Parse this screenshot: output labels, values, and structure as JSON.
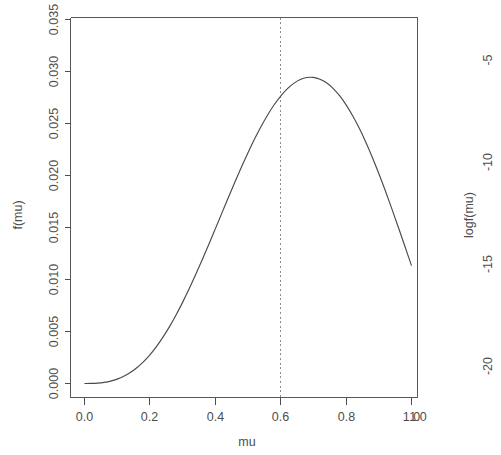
{
  "figure": {
    "background_color": "#ffffff",
    "line_color": "#4a4a4a",
    "text_color": "#4d4d4d",
    "vline_color": "#8c8c8c"
  },
  "panels": {
    "left": {
      "name": "density-panel",
      "xlabel": "mu",
      "ylabel": "f(mu)",
      "x_ticks": [
        "0.0",
        "0.2",
        "0.4",
        "0.6",
        "0.8",
        "1.0"
      ],
      "y_ticks": [
        "0.000",
        "0.005",
        "0.010",
        "0.015",
        "0.020",
        "0.025",
        "0.030",
        "0.035"
      ]
    },
    "right": {
      "name": "log-density-panel",
      "ylabel": "logf(mu)",
      "x_ticks": [
        "1.0"
      ],
      "y_ticks": [
        "-5",
        "-10",
        "-15",
        "-20"
      ]
    }
  },
  "chart_data": {
    "type": "line",
    "title": "",
    "xlabel": "mu",
    "ylabel": "f(mu)",
    "xlim": [
      0.0,
      1.0
    ],
    "ylim": [
      0.0,
      0.0355
    ],
    "grid": false,
    "legend": null,
    "x_ticks": [
      0.0,
      0.2,
      0.4,
      0.6,
      0.8,
      1.0
    ],
    "y_ticks": [
      0.0,
      0.005,
      0.01,
      0.015,
      0.02,
      0.025,
      0.03,
      0.035
    ],
    "series": [
      {
        "name": "f(mu)",
        "x": [
          0.0,
          0.02,
          0.04,
          0.06,
          0.08,
          0.1,
          0.12,
          0.14,
          0.16,
          0.18,
          0.2,
          0.22,
          0.24,
          0.26,
          0.28,
          0.3,
          0.32,
          0.34,
          0.36,
          0.38,
          0.4,
          0.42,
          0.44,
          0.46,
          0.48,
          0.5,
          0.52,
          0.54,
          0.56,
          0.58,
          0.6,
          0.62,
          0.64,
          0.66,
          0.68,
          0.7,
          0.72,
          0.74,
          0.76,
          0.78,
          0.8,
          0.82,
          0.84,
          0.86,
          0.88,
          0.9,
          0.92,
          0.94,
          0.96,
          0.98,
          1.0
        ],
        "y": [
          0.0,
          1e-05,
          4e-05,
          0.00011,
          0.00023,
          0.00042,
          0.00069,
          0.00105,
          0.00151,
          0.00208,
          0.00276,
          0.00355,
          0.00446,
          0.00547,
          0.00659,
          0.0078,
          0.0091,
          0.01047,
          0.0119,
          0.01337,
          0.01487,
          0.01638,
          0.01789,
          0.01937,
          0.02081,
          0.02219,
          0.0235,
          0.02471,
          0.02582,
          0.0268,
          0.02764,
          0.02833,
          0.02886,
          0.02923,
          0.02942,
          0.02943,
          0.02926,
          0.02891,
          0.02838,
          0.02767,
          0.02679,
          0.02575,
          0.02456,
          0.02322,
          0.02176,
          0.02019,
          0.01853,
          0.01679,
          0.015,
          0.01317,
          0.01133
        ],
        "style": "solid",
        "color": "#4a4a4a"
      }
    ],
    "annotations": [
      {
        "name": "mode-vline",
        "type": "vertical-dashed-line",
        "x": 0.6,
        "label": "",
        "color": "#8c8c8c"
      }
    ],
    "peak": {
      "x": 0.6,
      "y": 0.0345
    },
    "secondary_panel": {
      "type": "line",
      "ylabel": "logf(mu)",
      "y_ticks": [
        -5,
        -10,
        -15,
        -20
      ],
      "x_ticks": [
        1.0
      ]
    }
  }
}
